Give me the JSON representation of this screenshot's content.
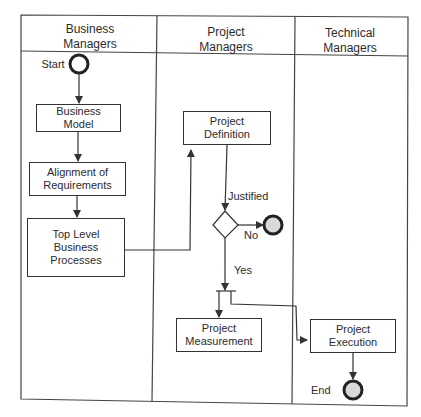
{
  "diagram": {
    "type": "swimlane-activity-diagram",
    "lanes": [
      {
        "id": "business",
        "title": "Business\nManagers"
      },
      {
        "id": "project",
        "title": "Project\nManagers"
      },
      {
        "id": "technical",
        "title": "Technical\nManagers"
      }
    ],
    "nodes": {
      "start": {
        "label": "Start"
      },
      "business_model": {
        "label": "Business\nModel"
      },
      "alignment": {
        "label": "Alignment of\nRequirements"
      },
      "top_level": {
        "label": "Top Level\nBusiness\nProcesses"
      },
      "project_definition": {
        "label": "Project\nDefinition"
      },
      "decision": {
        "guard_in": "Justified",
        "no": "No",
        "yes": "Yes"
      },
      "project_measurement": {
        "label": "Project\nMeasurement"
      },
      "project_execution": {
        "label": "Project\nExecution"
      },
      "end": {
        "label": "End"
      }
    },
    "edges": [
      {
        "from": "start",
        "to": "business_model"
      },
      {
        "from": "business_model",
        "to": "alignment"
      },
      {
        "from": "alignment",
        "to": "top_level"
      },
      {
        "from": "top_level",
        "to": "project_definition"
      },
      {
        "from": "project_definition",
        "to": "decision",
        "label": "Justified"
      },
      {
        "from": "decision",
        "to": "final_no",
        "label": "No"
      },
      {
        "from": "decision",
        "to": "fork",
        "label": "Yes"
      },
      {
        "from": "fork",
        "to": "project_measurement"
      },
      {
        "from": "fork",
        "to": "project_execution"
      },
      {
        "from": "project_execution",
        "to": "end"
      }
    ],
    "colors": {
      "line": "#333333",
      "final_fill": "#d9d9d9"
    }
  }
}
